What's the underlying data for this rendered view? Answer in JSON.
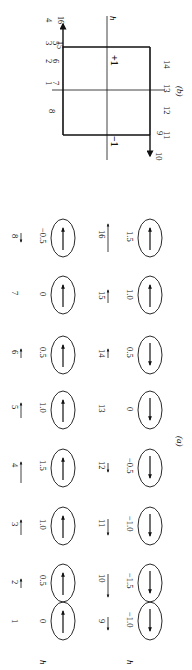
{
  "figure": {
    "orientation": "rotated-90-ccw",
    "part_a": {
      "caption": "(a)",
      "axis_label": "h",
      "rows": [
        {
          "row_label": "h",
          "steps": [
            {
              "step": "1",
              "underline": false,
              "arrow": "none",
              "h": "0",
              "moment": "up"
            },
            {
              "step": "2",
              "underline": true,
              "arrow": "up-short",
              "h": "0.5",
              "moment": "up"
            },
            {
              "step": "3",
              "underline": true,
              "arrow": "up",
              "h": "1.0",
              "moment": "up"
            },
            {
              "step": "4",
              "underline": true,
              "arrow": "up-long",
              "h": "1.5",
              "moment": "up"
            },
            {
              "step": "5",
              "underline": true,
              "arrow": "up",
              "h": "1.0",
              "moment": "up"
            },
            {
              "step": "6",
              "underline": true,
              "arrow": "up-short",
              "h": "0.5",
              "moment": "up"
            },
            {
              "step": "7",
              "underline": false,
              "arrow": "none",
              "h": "0",
              "moment": "up"
            },
            {
              "step": "8",
              "underline": true,
              "arrow": "down-short",
              "h": "−0.5",
              "moment": "up"
            }
          ]
        },
        {
          "row_label": "h",
          "steps": [
            {
              "step": "9",
              "underline": true,
              "arrow": "down",
              "h": "−1.0",
              "moment": "down"
            },
            {
              "step": "10",
              "underline": true,
              "arrow": "down-long",
              "h": "−1.5",
              "moment": "down"
            },
            {
              "step": "11",
              "underline": true,
              "arrow": "down",
              "h": "−1.0",
              "moment": "down"
            },
            {
              "step": "12",
              "underline": true,
              "arrow": "down-short",
              "h": "−0.5",
              "moment": "down"
            },
            {
              "step": "13",
              "underline": false,
              "arrow": "none",
              "h": "0",
              "moment": "down"
            },
            {
              "step": "14",
              "underline": true,
              "arrow": "up-short",
              "h": "0.5",
              "moment": "down"
            },
            {
              "step": "15",
              "underline": true,
              "arrow": "up",
              "h": "1.0",
              "moment": "up"
            },
            {
              "step": "16",
              "underline": true,
              "arrow": "up-long",
              "h": "1.5",
              "moment": "up"
            }
          ]
        }
      ]
    },
    "part_b": {
      "caption": "(b)",
      "axis_label": "h",
      "plus_label": "+1",
      "minus_label": "−1",
      "top_labels": {
        "a": "1",
        "b": "7",
        "c": "2",
        "d": "6",
        "e": "3",
        "f": "5",
        "g": "15",
        "h": "4",
        "i": "16",
        "j": "8"
      },
      "bottom_labels": {
        "a": "9",
        "b": "11",
        "c": "10",
        "d": "12",
        "e": "13",
        "f": "14"
      }
    }
  }
}
